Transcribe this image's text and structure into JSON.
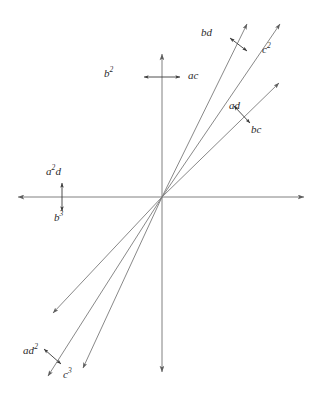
{
  "figure": {
    "type": "vector-diagram",
    "background_color": "#ffffff",
    "line_color": "#6b6b6b",
    "label_color": "#2b2b2b",
    "width": 325,
    "height": 405
  },
  "axes": {
    "origin": {
      "x": 162,
      "y": 197
    },
    "horizontal": {
      "x1": 12,
      "y1": 197,
      "x2": 310,
      "y2": 197,
      "arrow_start": true,
      "arrow_end": true
    },
    "vertical": {
      "x1": 162,
      "y1": 48,
      "x2": 162,
      "y2": 378,
      "arrow_start": true,
      "arrow_end": true
    }
  },
  "rays": [
    {
      "id": "ray-bd",
      "x1": 162,
      "y1": 197,
      "x2": 250,
      "y2": 18,
      "arrow_end": true
    },
    {
      "id": "ray-c2",
      "x1": 162,
      "y1": 197,
      "x2": 283,
      "y2": 18,
      "arrow_end": true
    },
    {
      "id": "ray-bc",
      "x1": 162,
      "y1": 197,
      "x2": 283,
      "y2": 78,
      "arrow_end": true
    },
    {
      "id": "ray-ad2",
      "x1": 162,
      "y1": 197,
      "x2": 48,
      "y2": 318,
      "arrow_end": true
    },
    {
      "id": "ray-c3",
      "x1": 162,
      "y1": 197,
      "x2": 43,
      "y2": 382,
      "arrow_end": true
    },
    {
      "id": "ray-opposite-bc",
      "x1": 162,
      "y1": 197,
      "x2": 78,
      "y2": 375,
      "arrow_end": true
    }
  ],
  "markers": [
    {
      "id": "marker-b2-ac",
      "x1": 140,
      "y1": 77,
      "x2": 184,
      "y2": 77,
      "orientation": "horizontal"
    },
    {
      "id": "marker-a2d-b3",
      "x1": 62,
      "y1": 180,
      "x2": 62,
      "y2": 214,
      "orientation": "vertical"
    },
    {
      "id": "marker-bd",
      "x1": 228,
      "y1": 36,
      "x2": 249,
      "y2": 52,
      "orientation": "diagonal"
    },
    {
      "id": "marker-ad-bc",
      "x1": 232,
      "y1": 104,
      "x2": 252,
      "y2": 125,
      "orientation": "diagonal"
    },
    {
      "id": "marker-ad2-c3",
      "x1": 42,
      "y1": 347,
      "x2": 63,
      "y2": 366,
      "orientation": "diagonal"
    }
  ],
  "labels": [
    {
      "id": "label-bd",
      "base": "bd",
      "sup": "",
      "x": 201,
      "y": 27
    },
    {
      "id": "label-c2",
      "base": "c",
      "sup": "2",
      "x": 262,
      "y": 44
    },
    {
      "id": "label-ad",
      "base": "ad",
      "sup": "",
      "x": 229,
      "y": 100
    },
    {
      "id": "label-bc",
      "base": "bc",
      "sup": "",
      "x": 251,
      "y": 124
    },
    {
      "id": "label-b2",
      "base": "b",
      "sup": "2",
      "x": 104,
      "y": 68
    },
    {
      "id": "label-ac",
      "base": "ac",
      "sup": "",
      "x": 188,
      "y": 70
    },
    {
      "id": "label-a2d",
      "base": "a",
      "sup": "2",
      "extra": "d",
      "x": 46,
      "y": 166
    },
    {
      "id": "label-b3",
      "base": "b",
      "sup": "3",
      "x": 54,
      "y": 212
    },
    {
      "id": "label-ad2",
      "base": "ad",
      "sup": "2",
      "x": 23,
      "y": 345
    },
    {
      "id": "label-c3",
      "base": "c",
      "sup": "3",
      "x": 63,
      "y": 369
    }
  ],
  "label_text": {
    "bd": "bd",
    "c2_base": "c",
    "c2_sup": "2",
    "ad": "ad",
    "bc": "bc",
    "b2_base": "b",
    "b2_sup": "2",
    "ac": "ac",
    "a2d_base": "a",
    "a2d_sup": "2",
    "a2d_tail": "d",
    "b3_base": "b",
    "b3_sup": "3",
    "ad2_base": "ad",
    "ad2_sup": "2",
    "c3_base": "c",
    "c3_sup": "3"
  }
}
